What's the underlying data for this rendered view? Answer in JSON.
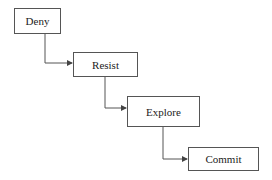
{
  "diagram": {
    "type": "flowchart-staircase",
    "nodes": [
      {
        "id": "deny",
        "label": "Deny"
      },
      {
        "id": "resist",
        "label": "Resist"
      },
      {
        "id": "explore",
        "label": "Explore"
      },
      {
        "id": "commit",
        "label": "Commit"
      }
    ],
    "edges": [
      {
        "from": "deny",
        "to": "resist"
      },
      {
        "from": "resist",
        "to": "explore"
      },
      {
        "from": "explore",
        "to": "commit"
      }
    ],
    "colors": {
      "stroke": "#555555",
      "text": "#222222",
      "background": "#ffffff"
    }
  }
}
